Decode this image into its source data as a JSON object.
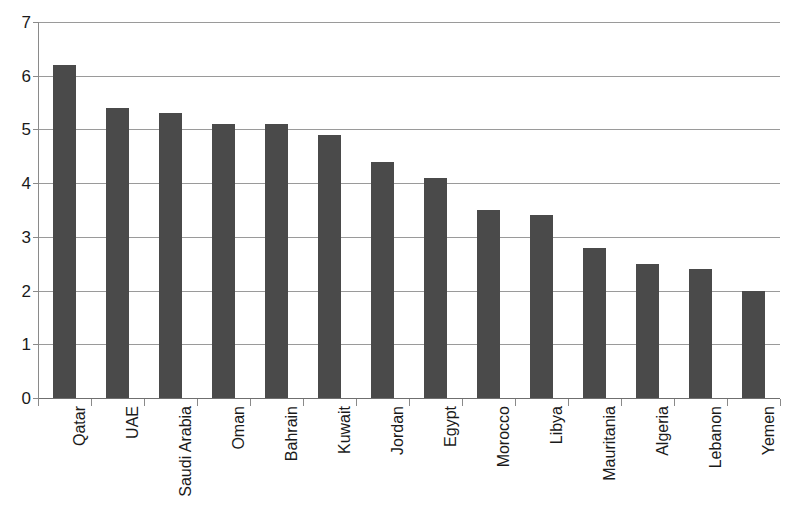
{
  "chart_data": {
    "type": "bar",
    "title": "",
    "xlabel": "",
    "ylabel": "",
    "ylim": [
      0,
      7
    ],
    "yticks": [
      0,
      1,
      2,
      3,
      4,
      5,
      6,
      7
    ],
    "grid": true,
    "legend": false,
    "bar_color": "#4a4a4a",
    "gridline_color": "#9a9a9a",
    "categories": [
      "Qatar",
      "UAE",
      "Saudi Arabia",
      "Oman",
      "Bahrain",
      "Kuwait",
      "Jordan",
      "Egypt",
      "Morocco",
      "Libya",
      "Mauritania",
      "Algeria",
      "Lebanon",
      "Yemen"
    ],
    "values": [
      6.2,
      5.4,
      5.3,
      5.1,
      5.1,
      4.9,
      4.4,
      4.1,
      3.5,
      3.4,
      2.8,
      2.5,
      2.4,
      2.0
    ]
  }
}
